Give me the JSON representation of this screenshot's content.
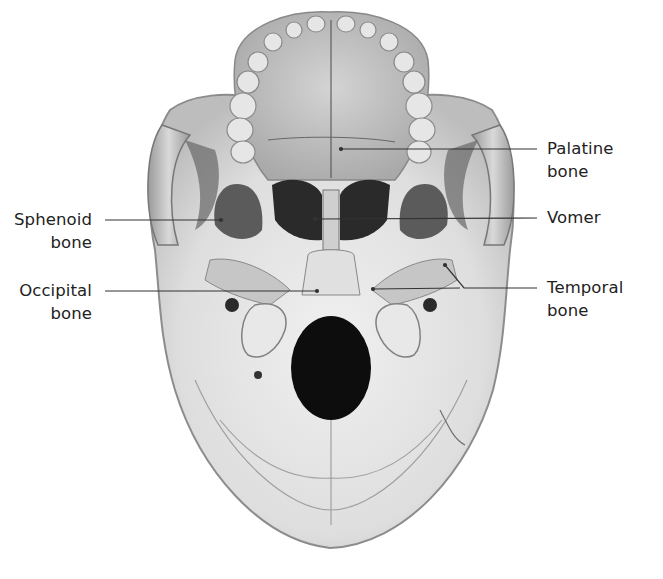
{
  "figure": {
    "colors": {
      "background": "#ffffff",
      "bone_light": "#ececec",
      "bone_mid": "#c8c8c8",
      "bone_dark": "#8a8a8a",
      "foramen": "#0d0d0d",
      "leader_line": "#333333",
      "label_text": "#222222"
    }
  },
  "labels": [
    {
      "id": "palatine",
      "line1": "Palatine",
      "line2": "bone",
      "side": "right"
    },
    {
      "id": "vomer",
      "line1": "Vomer",
      "line2": "",
      "side": "right"
    },
    {
      "id": "temporal",
      "line1": "Temporal",
      "line2": "bone",
      "side": "right"
    },
    {
      "id": "sphenoid",
      "line1": "Sphenoid",
      "line2": "bone",
      "side": "left"
    },
    {
      "id": "occipital",
      "line1": "Occipital",
      "line2": "bone",
      "side": "left"
    }
  ]
}
